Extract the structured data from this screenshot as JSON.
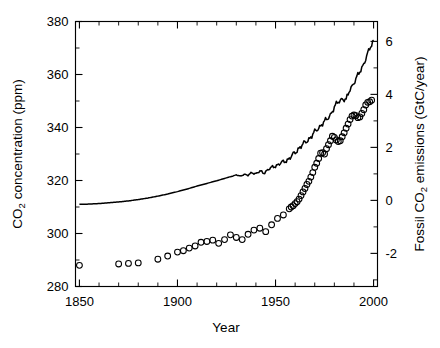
{
  "figure": {
    "width": 440,
    "height": 348,
    "background": "#ffffff",
    "foreground": "#000000"
  },
  "axes": {
    "x": {
      "title": "Year",
      "min": 1848,
      "max": 2002,
      "major_ticks": [
        1850,
        1900,
        1950,
        2000
      ],
      "major_tick_labels": [
        "1850",
        "1900",
        "1950",
        "2000"
      ],
      "minor_tick_step": 10
    },
    "y_left": {
      "title_parts": [
        "CO",
        "2",
        " concentration (ppm)"
      ],
      "title": "CO2 concentration (ppm)",
      "min": 280,
      "max": 380,
      "major_ticks": [
        280,
        300,
        320,
        340,
        360,
        380
      ],
      "major_tick_labels": [
        "280",
        "300",
        "320",
        "340",
        "360",
        "380"
      ],
      "minor_tick_step": 10
    },
    "y_right": {
      "title_parts": [
        "Fossil CO",
        "2",
        " emissions (GtC/year)"
      ],
      "title": "Fossil CO2 emissions (GtC/year)",
      "min": -3.25,
      "max": 6.75,
      "major_ticks": [
        -2,
        0,
        2,
        4,
        6
      ],
      "major_tick_labels": [
        "-2",
        "0",
        "2",
        "4",
        "6"
      ],
      "minor_tick_step": 1
    }
  },
  "chart_data": {
    "type": "line",
    "title": "",
    "subtitle": "",
    "xlabel": "Year",
    "ylabel": "CO2 concentration (ppm)",
    "ylabel_secondary": "Fossil CO2 emissions (GtC/year)",
    "xlim": [
      1848,
      2002
    ],
    "ylim": [
      280,
      380
    ],
    "ylim_secondary": [
      -3.25,
      6.75
    ],
    "grid": false,
    "legend": "none",
    "series": [
      {
        "name": "CO2 concentration (ppm)",
        "axis": "left",
        "style": "solid-line",
        "marker": "none",
        "color": "#000000",
        "x": [
          1850,
          1855,
          1860,
          1865,
          1870,
          1875,
          1880,
          1885,
          1890,
          1895,
          1900,
          1905,
          1910,
          1915,
          1920,
          1925,
          1930,
          1932,
          1934,
          1936,
          1938,
          1940,
          1942,
          1944,
          1946,
          1948,
          1950,
          1952,
          1954,
          1956,
          1958,
          1960,
          1962,
          1964,
          1966,
          1968,
          1970,
          1972,
          1974,
          1976,
          1978,
          1980,
          1982,
          1984,
          1986,
          1988,
          1990,
          1992,
          1994,
          1996,
          1998,
          2000
        ],
        "y": [
          311.0,
          311.1,
          311.3,
          311.6,
          311.9,
          312.3,
          312.8,
          313.4,
          314.1,
          314.9,
          315.8,
          316.8,
          317.9,
          318.9,
          319.9,
          321.0,
          322.1,
          321.6,
          322.4,
          321.9,
          323.0,
          322.6,
          323.4,
          322.9,
          324.0,
          324.8,
          325.6,
          326.2,
          327.0,
          327.8,
          328.9,
          330.6,
          332.3,
          333.5,
          335.0,
          336.4,
          338.2,
          340.0,
          341.5,
          342.8,
          345.0,
          347.5,
          349.7,
          351.0,
          350.2,
          354.5,
          357.0,
          359.5,
          362.5,
          366.0,
          369.5,
          373.0
        ]
      },
      {
        "name": "Fossil CO2 emissions (GtC/year)",
        "axis": "right",
        "style": "markers",
        "marker": "open-circle",
        "color": "#000000",
        "x": [
          1850,
          1870,
          1875,
          1880,
          1890,
          1895,
          1900,
          1903,
          1906,
          1909,
          1912,
          1915,
          1918,
          1921,
          1924,
          1927,
          1930,
          1933,
          1936,
          1939,
          1942,
          1945,
          1948,
          1951,
          1954,
          1957,
          1958,
          1959,
          1960,
          1961,
          1962,
          1963,
          1964,
          1965,
          1966,
          1967,
          1968,
          1969,
          1970,
          1971,
          1972,
          1973,
          1974,
          1975,
          1976,
          1977,
          1978,
          1979,
          1980,
          1981,
          1982,
          1983,
          1984,
          1985,
          1986,
          1987,
          1988,
          1989,
          1990,
          1991,
          1992,
          1993,
          1994,
          1995,
          1996,
          1997,
          1998,
          1999
        ],
        "y": [
          -2.45,
          -2.4,
          -2.38,
          -2.36,
          -2.22,
          -2.1,
          -1.95,
          -1.9,
          -1.8,
          -1.72,
          -1.58,
          -1.55,
          -1.5,
          -1.62,
          -1.48,
          -1.3,
          -1.4,
          -1.48,
          -1.28,
          -1.12,
          -1.05,
          -1.18,
          -0.92,
          -0.68,
          -0.55,
          -0.32,
          -0.25,
          -0.2,
          -0.12,
          -0.05,
          0.05,
          0.18,
          0.32,
          0.45,
          0.6,
          0.72,
          0.88,
          1.05,
          1.25,
          1.4,
          1.58,
          1.78,
          1.8,
          1.75,
          1.95,
          2.1,
          2.25,
          2.42,
          2.38,
          2.28,
          2.22,
          2.25,
          2.4,
          2.55,
          2.72,
          2.88,
          3.05,
          3.18,
          3.22,
          3.2,
          3.12,
          3.15,
          3.28,
          3.42,
          3.6,
          3.7,
          3.72,
          3.78
        ]
      }
    ]
  }
}
